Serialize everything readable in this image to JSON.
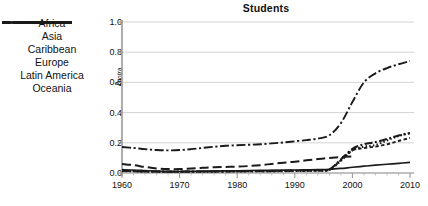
{
  "chart_data": {
    "type": "line",
    "title": "Students",
    "xlabel": "",
    "ylabel": "Δ",
    "ylabel_sub": "intra",
    "xlim": [
      1960,
      2010
    ],
    "ylim": [
      0.0,
      1.0
    ],
    "yticks": [
      "0.0",
      "0.2",
      "0.4",
      "0.6",
      "0.8",
      "1.0"
    ],
    "ytick_values": [
      0.0,
      0.2,
      0.4,
      0.6,
      0.8,
      1.0
    ],
    "xticks": [
      "1960",
      "1970",
      "1980",
      "1990",
      "2000",
      "2010"
    ],
    "xtick_values": [
      1960,
      1970,
      1980,
      1990,
      2000,
      2010
    ],
    "grid": true,
    "legend_position": "left-outside",
    "x": [
      1960,
      1962,
      1964,
      1966,
      1968,
      1970,
      1972,
      1974,
      1976,
      1978,
      1980,
      1982,
      1984,
      1986,
      1988,
      1990,
      1992,
      1994,
      1996,
      1998,
      2000,
      2002,
      2004,
      2006,
      2008,
      2010
    ],
    "series": [
      {
        "name": "Africa",
        "style": "solid",
        "values": [
          0.022,
          0.02,
          0.016,
          0.012,
          0.01,
          0.01,
          0.011,
          0.012,
          0.013,
          0.014,
          0.015,
          0.016,
          0.017,
          0.018,
          0.019,
          0.02,
          0.021,
          0.022,
          0.024,
          0.03,
          0.038,
          0.045,
          0.052,
          0.058,
          0.064,
          0.07
        ]
      },
      {
        "name": "Asia",
        "style": "dash-dot",
        "values": [
          0.172,
          0.166,
          0.158,
          0.152,
          0.15,
          0.152,
          0.158,
          0.166,
          0.174,
          0.18,
          0.184,
          0.187,
          0.19,
          0.196,
          0.202,
          0.21,
          0.218,
          0.228,
          0.25,
          0.33,
          0.47,
          0.6,
          0.66,
          0.695,
          0.72,
          0.742
        ]
      },
      {
        "name": "Caribbean",
        "style": "dotted",
        "values": [
          0.012,
          0.011,
          0.01,
          0.009,
          0.008,
          0.008,
          0.008,
          0.009,
          0.009,
          0.01,
          0.01,
          0.011,
          0.011,
          0.012,
          0.012,
          0.013,
          0.014,
          0.015,
          0.02,
          0.08,
          0.15,
          0.175,
          0.185,
          0.215,
          0.245,
          0.262
        ]
      },
      {
        "name": "Europe",
        "style": "dash-dot-thick",
        "values": [
          0.014,
          0.013,
          0.011,
          0.01,
          0.009,
          0.009,
          0.01,
          0.01,
          0.011,
          0.012,
          0.012,
          0.013,
          0.013,
          0.014,
          0.015,
          0.016,
          0.017,
          0.018,
          0.024,
          0.09,
          0.16,
          0.19,
          0.205,
          0.225,
          0.248,
          0.265
        ]
      },
      {
        "name": "Latin America",
        "style": "dashed-short",
        "values": [
          0.013,
          0.012,
          0.01,
          0.009,
          0.008,
          0.008,
          0.009,
          0.009,
          0.01,
          0.01,
          0.011,
          0.011,
          0.012,
          0.012,
          0.013,
          0.014,
          0.015,
          0.016,
          0.022,
          0.085,
          0.15,
          0.165,
          0.175,
          0.19,
          0.212,
          0.232
        ]
      },
      {
        "name": "Oceania",
        "style": "dashed-long",
        "values": [
          0.06,
          0.052,
          0.04,
          0.03,
          0.026,
          0.026,
          0.03,
          0.034,
          0.038,
          0.04,
          0.042,
          0.046,
          0.052,
          0.06,
          0.068,
          0.075,
          0.084,
          0.092,
          0.1,
          0.106,
          0.11,
          null,
          null,
          null,
          null,
          null
        ]
      }
    ]
  },
  "legend": {
    "items": [
      {
        "label": "Africa",
        "style": "solid"
      },
      {
        "label": "Asia",
        "style": "dash-dot"
      },
      {
        "label": "Caribbean",
        "style": "dotted"
      },
      {
        "label": "Europe",
        "style": "dash-dot-thick"
      },
      {
        "label": "Latin America",
        "style": "dashed-short"
      },
      {
        "label": "Oceania",
        "style": "dashed-long"
      }
    ]
  },
  "colors": {
    "line": "#1a1a1a",
    "grid": "#c8c8c8",
    "axis": "#808080",
    "text": "#111111",
    "background": "#ffffff"
  }
}
